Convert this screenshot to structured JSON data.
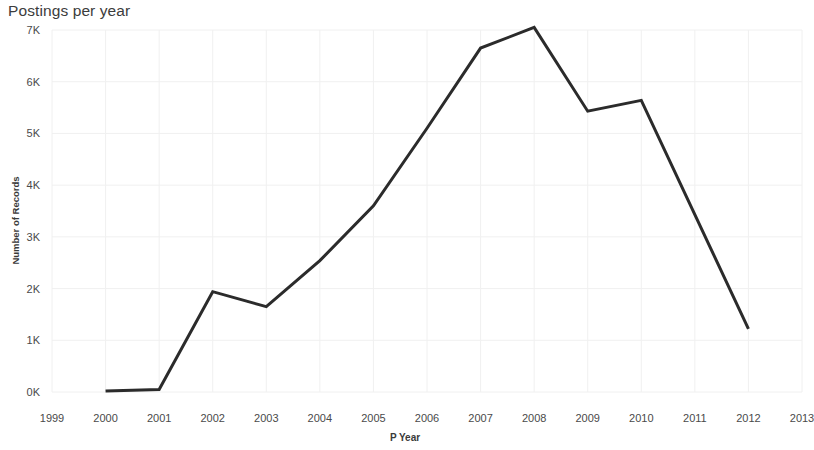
{
  "chart_data": {
    "type": "line",
    "title": "Postings per year",
    "xlabel": "P Year",
    "ylabel": "Number of Records",
    "x": [
      2000,
      2001,
      2002,
      2003,
      2004,
      2005,
      2006,
      2007,
      2008,
      2009,
      2010,
      2012
    ],
    "values": [
      20,
      50,
      1940,
      1650,
      2540,
      3600,
      5100,
      6650,
      7050,
      5430,
      5640,
      1220
    ],
    "series": [
      {
        "name": "Number of Records",
        "values": [
          20,
          50,
          1940,
          1650,
          2540,
          3600,
          5100,
          6650,
          7050,
          5430,
          5640,
          1220
        ]
      }
    ],
    "xlim": [
      1999,
      2013
    ],
    "ylim": [
      0,
      7000
    ],
    "x_tick_labels": [
      "1999",
      "2000",
      "2001",
      "2002",
      "2003",
      "2004",
      "2005",
      "2006",
      "2007",
      "2008",
      "2009",
      "2010",
      "2011",
      "2012",
      "2013"
    ],
    "x_tick_values": [
      1999,
      2000,
      2001,
      2002,
      2003,
      2004,
      2005,
      2006,
      2007,
      2008,
      2009,
      2010,
      2011,
      2012,
      2013
    ],
    "y_tick_labels": [
      "0K",
      "1K",
      "2K",
      "3K",
      "4K",
      "5K",
      "6K",
      "7K"
    ],
    "y_tick_values": [
      0,
      1000,
      2000,
      3000,
      4000,
      5000,
      6000,
      7000
    ],
    "grid": true,
    "legend": false,
    "line_color": "#2b2b2b",
    "grid_color": "#f0f0f0",
    "background_color": "#ffffff"
  }
}
